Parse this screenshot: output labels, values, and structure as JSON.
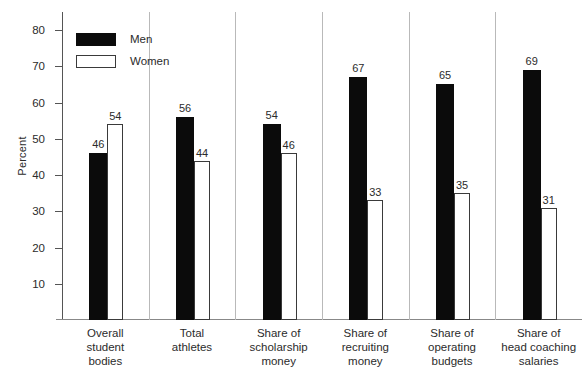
{
  "chart_data": {
    "type": "bar",
    "title": "",
    "subtitle": "",
    "xlabel": "",
    "ylabel": "Percent",
    "ylim": [
      0,
      85
    ],
    "yticks": [
      10,
      20,
      30,
      40,
      50,
      60,
      70,
      80
    ],
    "ytick_labels": [
      "10",
      "20",
      "30",
      "40",
      "50",
      "60",
      "70",
      "80"
    ],
    "grid": false,
    "legend_position": "top-left",
    "categories": [
      "Overall student bodies",
      "Total athletes",
      "Share of scholarship money",
      "Share of recruiting money",
      "Share of operating budgets",
      "Share of head coaching salaries"
    ],
    "category_lines": [
      [
        "Overall",
        "student",
        "bodies"
      ],
      [
        "Total",
        "athletes"
      ],
      [
        "Share of",
        "scholarship",
        "money"
      ],
      [
        "Share of",
        "recruiting",
        "money"
      ],
      [
        "Share of",
        "operating",
        "budgets"
      ],
      [
        "Share of",
        "head coaching",
        "salaries"
      ]
    ],
    "series": [
      {
        "name": "Men",
        "color": "#0b0b0b",
        "values": [
          46,
          56,
          54,
          67,
          65,
          69
        ]
      },
      {
        "name": "Women",
        "color": "#ffffff",
        "values": [
          54,
          44,
          46,
          33,
          35,
          31
        ]
      }
    ]
  },
  "legend": {
    "items": [
      {
        "label": "Men"
      },
      {
        "label": "Women"
      }
    ]
  },
  "colors": {
    "men_fill": "#0b0b0b",
    "women_fill": "#ffffff",
    "women_stroke": "#3a3a3a",
    "axis": "#555555",
    "text": "#2b2b2b",
    "background": "#ffffff"
  }
}
